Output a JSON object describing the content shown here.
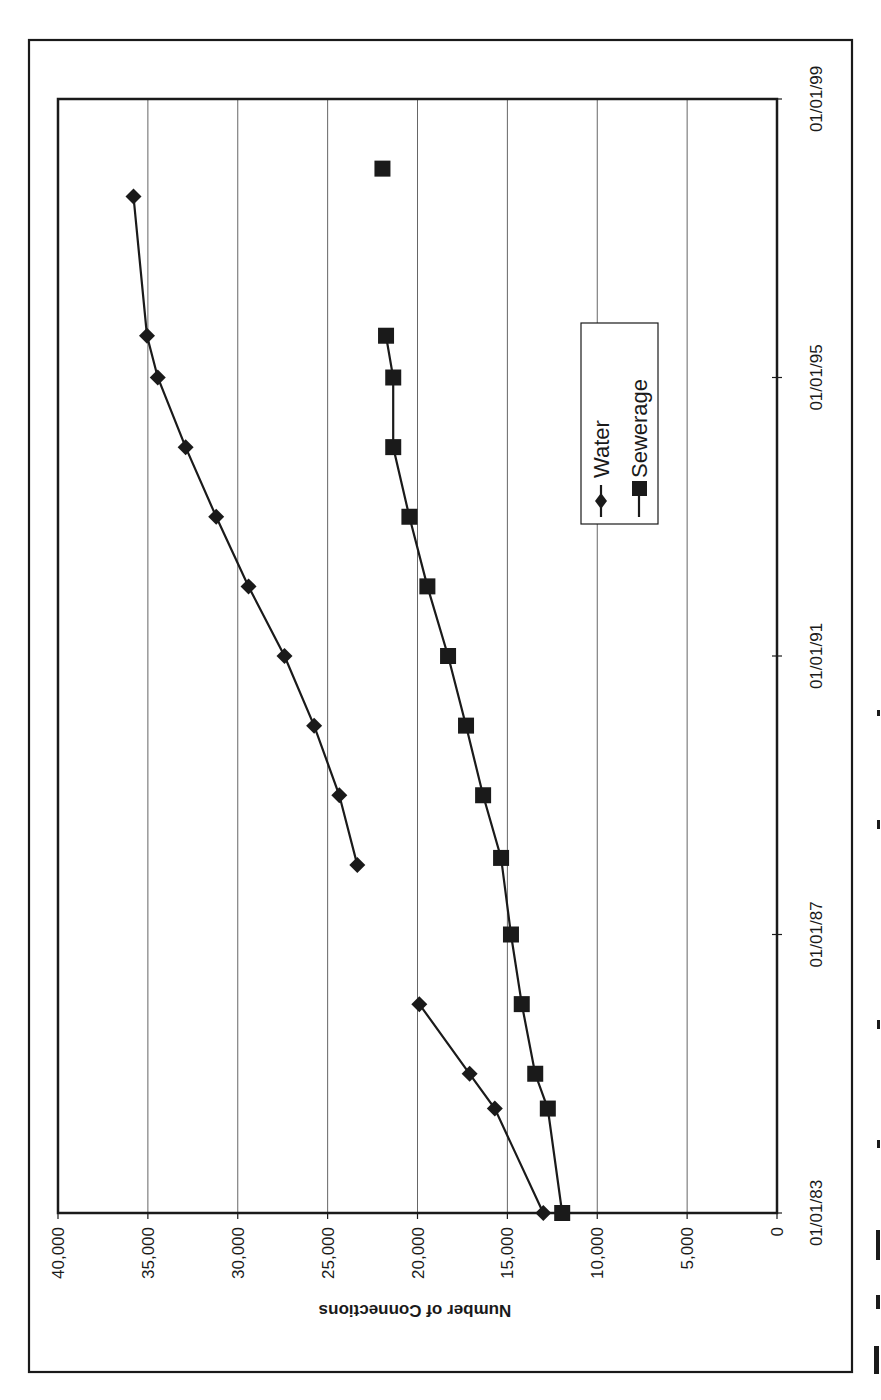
{
  "chart_data": {
    "type": "line",
    "orientation": "rotated-90-ccw",
    "title": "",
    "xlabel": "",
    "ylabel": "Number of Connections",
    "x_ticks": [
      "01/01/83",
      "01/01/87",
      "01/01/91",
      "01/01/95",
      "01/01/99"
    ],
    "x_range": [
      1983.0,
      1999.0
    ],
    "y_ticks": [
      "0",
      "5,000",
      "10,000",
      "15,000",
      "20,000",
      "25,000",
      "30,000",
      "35,000",
      "40,000"
    ],
    "ylim": [
      0,
      40000
    ],
    "grid": "horizontal major (y)",
    "legend_position": "inside right-middle",
    "series": [
      {
        "name": "Water",
        "marker": "diamond",
        "segments": [
          [
            {
              "x": 1983.0,
              "y": 13000
            },
            {
              "x": 1984.5,
              "y": 15700
            },
            {
              "x": 1985.0,
              "y": 17100
            },
            {
              "x": 1986.0,
              "y": 19900
            }
          ],
          [
            {
              "x": 1988.0,
              "y": 23350
            },
            {
              "x": 1989.0,
              "y": 24350
            },
            {
              "x": 1990.0,
              "y": 25750
            },
            {
              "x": 1991.0,
              "y": 27400
            },
            {
              "x": 1992.0,
              "y": 29400
            },
            {
              "x": 1993.0,
              "y": 31200
            },
            {
              "x": 1994.0,
              "y": 32900
            },
            {
              "x": 1995.0,
              "y": 34450
            },
            {
              "x": 1995.6,
              "y": 35050
            },
            {
              "x": 1997.6,
              "y": 35800
            }
          ]
        ]
      },
      {
        "name": "Sewerage",
        "marker": "square",
        "segments": [
          [
            {
              "x": 1983.0,
              "y": 11950
            },
            {
              "x": 1984.5,
              "y": 12750
            },
            {
              "x": 1985.0,
              "y": 13450
            },
            {
              "x": 1986.0,
              "y": 14200
            },
            {
              "x": 1987.0,
              "y": 14800
            },
            {
              "x": 1988.1,
              "y": 15350
            },
            {
              "x": 1989.0,
              "y": 16350
            },
            {
              "x": 1990.0,
              "y": 17300
            },
            {
              "x": 1991.0,
              "y": 18300
            },
            {
              "x": 1992.0,
              "y": 19450
            },
            {
              "x": 1993.0,
              "y": 20450
            },
            {
              "x": 1994.0,
              "y": 21350
            },
            {
              "x": 1995.0,
              "y": 21350
            },
            {
              "x": 1995.6,
              "y": 21750
            }
          ],
          [
            {
              "x": 1998.0,
              "y": 21950
            }
          ]
        ]
      }
    ]
  },
  "legend": {
    "items": [
      {
        "label": "Water",
        "marker": "diamond"
      },
      {
        "label": "Sewerage",
        "marker": "square"
      }
    ]
  },
  "colors": {
    "ink": "#1a1a1a",
    "grid": "#555555",
    "background": "#ffffff"
  }
}
